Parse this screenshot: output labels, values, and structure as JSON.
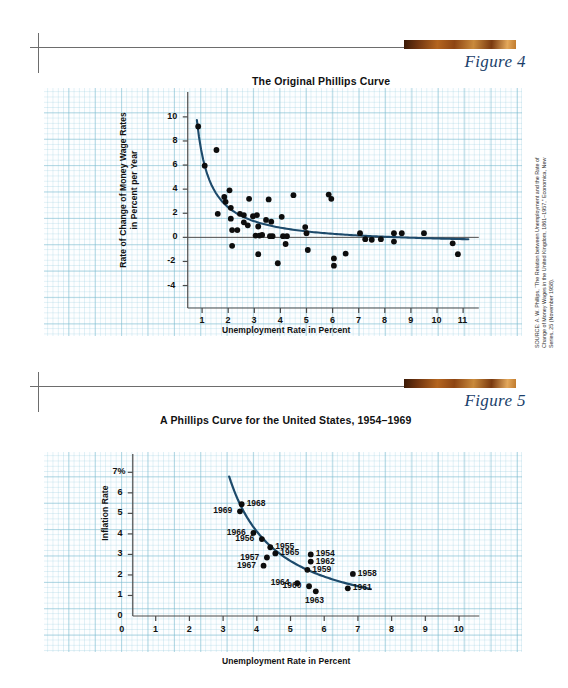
{
  "page": {
    "background": "#ffffff",
    "accent_brown": "#8d4513",
    "curve_color": "#1d4a6b",
    "grid_color": "#78b9cd",
    "figure_number_color": "#1b3f6b"
  },
  "figure4": {
    "number": "Figure 4",
    "title": "The Original Phillips Curve",
    "source": "SOURCE: A. W. Phillips, “The Relation between Unemployment and the Rate of Change of Money Wages in the United Kingdom, 1861–1957,” Economica, New Series, 25 (November 1958).",
    "chart_data": {
      "type": "scatter",
      "title": "The Original Phillips Curve",
      "xlabel": "Unemployment Rate in Percent",
      "ylabel": "Rate of Change of Money Wage Rates in Percent per Year",
      "xlim": [
        0,
        11.8
      ],
      "ylim": [
        -5.2,
        11.4
      ],
      "xticks": [
        1,
        2,
        3,
        4,
        5,
        6,
        7,
        8,
        9,
        10,
        11
      ],
      "yticks": [
        -4,
        -2,
        0,
        2,
        4,
        6,
        8,
        10
      ],
      "grid": true,
      "legend": "none",
      "zero_line": true,
      "points": [
        [
          0.85,
          9.2
        ],
        [
          1.1,
          5.95
        ],
        [
          1.55,
          7.25
        ],
        [
          1.6,
          1.95
        ],
        [
          1.85,
          3.35
        ],
        [
          1.9,
          2.95
        ],
        [
          2.05,
          3.9
        ],
        [
          2.1,
          2.45
        ],
        [
          2.1,
          1.55
        ],
        [
          2.15,
          0.6
        ],
        [
          2.15,
          -0.7
        ],
        [
          2.35,
          0.6
        ],
        [
          2.45,
          1.95
        ],
        [
          2.6,
          1.85
        ],
        [
          2.6,
          1.25
        ],
        [
          2.75,
          1.0
        ],
        [
          2.8,
          3.2
        ],
        [
          2.95,
          1.75
        ],
        [
          3.05,
          0.15
        ],
        [
          3.1,
          1.85
        ],
        [
          3.15,
          0.9
        ],
        [
          3.15,
          -1.4
        ],
        [
          3.2,
          0.15
        ],
        [
          3.3,
          0.2
        ],
        [
          3.45,
          1.45
        ],
        [
          3.55,
          3.15
        ],
        [
          3.6,
          0.1
        ],
        [
          3.65,
          1.3
        ],
        [
          3.7,
          0.1
        ],
        [
          3.9,
          -2.15
        ],
        [
          4.05,
          1.7
        ],
        [
          4.1,
          0.1
        ],
        [
          4.2,
          -0.55
        ],
        [
          4.25,
          0.1
        ],
        [
          4.5,
          3.5
        ],
        [
          4.95,
          0.85
        ],
        [
          5.0,
          0.35
        ],
        [
          5.05,
          -1.05
        ],
        [
          5.85,
          3.55
        ],
        [
          5.95,
          3.2
        ],
        [
          6.05,
          -1.75
        ],
        [
          6.05,
          -2.35
        ],
        [
          6.5,
          -1.35
        ],
        [
          7.05,
          0.35
        ],
        [
          7.25,
          -0.15
        ],
        [
          7.5,
          -0.2
        ],
        [
          7.85,
          -0.15
        ],
        [
          8.35,
          0.35
        ],
        [
          8.35,
          -0.35
        ],
        [
          8.65,
          0.35
        ],
        [
          9.5,
          0.35
        ],
        [
          10.6,
          -0.5
        ],
        [
          10.8,
          -1.4
        ]
      ],
      "fitted_curve_note": "Downward-sloping convex Phillips curve asymptotic to about 0"
    }
  },
  "figure5": {
    "number": "Figure 5",
    "title": "A Phillips Curve for the United States, 1954–1969",
    "chart_data": {
      "type": "scatter",
      "title": "A Phillips Curve for the United States, 1954–1969",
      "xlabel": "Unemployment Rate in Percent",
      "ylabel": "Inflation Rate",
      "xlim": [
        0,
        10.8
      ],
      "ylim": [
        0,
        7.6
      ],
      "xticks": [
        0,
        1,
        2,
        3,
        4,
        5,
        6,
        7,
        8,
        9,
        10
      ],
      "yticks": [
        "0",
        "1",
        "2",
        "3",
        "4",
        "5",
        "6",
        "7%"
      ],
      "grid": true,
      "legend": "none",
      "labeled_points": [
        {
          "label": "1968",
          "x": 3.55,
          "y": 5.45,
          "label_pos": "right"
        },
        {
          "label": "1969",
          "x": 3.5,
          "y": 5.1,
          "label_pos": "left"
        },
        {
          "label": "1966",
          "x": 3.9,
          "y": 4.05,
          "label_pos": "left"
        },
        {
          "label": "1956",
          "x": 4.15,
          "y": 3.75,
          "label_pos": "left"
        },
        {
          "label": "1955",
          "x": 4.4,
          "y": 3.35,
          "label_pos": "right"
        },
        {
          "label": "1965",
          "x": 4.55,
          "y": 3.05,
          "label_pos": "right"
        },
        {
          "label": "1957",
          "x": 4.3,
          "y": 2.85,
          "label_pos": "left"
        },
        {
          "label": "1967",
          "x": 4.2,
          "y": 2.45,
          "label_pos": "left"
        },
        {
          "label": "1954",
          "x": 5.6,
          "y": 3.0,
          "label_pos": "right"
        },
        {
          "label": "1962",
          "x": 5.6,
          "y": 2.65,
          "label_pos": "right"
        },
        {
          "label": "1959",
          "x": 5.5,
          "y": 2.25,
          "label_pos": "right"
        },
        {
          "label": "1958",
          "x": 6.85,
          "y": 2.05,
          "label_pos": "right"
        },
        {
          "label": "1964",
          "x": 5.2,
          "y": 1.6,
          "label_pos": "left"
        },
        {
          "label": "1960",
          "x": 5.55,
          "y": 1.45,
          "label_pos": "left"
        },
        {
          "label": "1961",
          "x": 6.7,
          "y": 1.35,
          "label_pos": "right"
        },
        {
          "label": "1963",
          "x": 5.75,
          "y": 1.2,
          "label_pos": "below"
        }
      ],
      "fitted_curve_note": "Smooth convex downward-sloping curve from about (3.2, 7.3) to (7.4, 1.0)"
    }
  }
}
